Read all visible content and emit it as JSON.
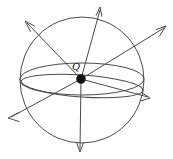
{
  "figure": {
    "center_label": "Q",
    "center_label_position": {
      "x": 76,
      "y": 70
    },
    "colors": {
      "stroke": "#4a4a4a",
      "charge_fill": "#111111",
      "background": "#ffffff"
    },
    "sphere": {
      "center_x": 82,
      "center_y": 80,
      "radius_x": 62,
      "radius_y": 63
    },
    "charge": {
      "x": 81,
      "y": 79,
      "radius": 4.5
    },
    "great_circles": [
      {
        "name": "equator-ellipse",
        "cx": 82,
        "cy": 79,
        "rx": 62,
        "ry": 16,
        "rotation": 0
      },
      {
        "name": "tilted-ellipse",
        "cx": 82,
        "cy": 86,
        "rx": 61,
        "ry": 11,
        "rotation": 4
      }
    ],
    "field_lines": [
      {
        "name": "field-line-up",
        "x1": 81,
        "y1": 79,
        "x2": 100,
        "y2": 8
      },
      {
        "name": "field-line-upper-right",
        "x1": 81,
        "y1": 79,
        "x2": 166,
        "y2": 27
      },
      {
        "name": "field-line-right",
        "x1": 81,
        "y1": 79,
        "x2": 150,
        "y2": 98
      },
      {
        "name": "field-line-down",
        "x1": 81,
        "y1": 79,
        "x2": 80,
        "y2": 151
      },
      {
        "name": "field-line-lower-left",
        "x1": 81,
        "y1": 79,
        "x2": 9,
        "y2": 118
      },
      {
        "name": "field-line-upper-left",
        "x1": 81,
        "y1": 79,
        "x2": 25,
        "y2": 21
      }
    ]
  }
}
